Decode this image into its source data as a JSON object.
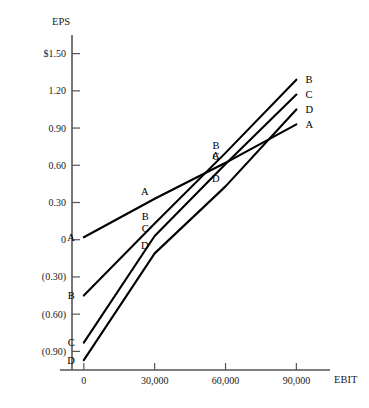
{
  "chart_data": {
    "type": "line",
    "title": "",
    "xlabel": "EBIT",
    "ylabel": "EPS",
    "xlim": [
      -5000,
      100000
    ],
    "ylim": [
      -1.05,
      1.65
    ],
    "grid": false,
    "legend": "none",
    "x_ticks": [
      {
        "value": 0,
        "label": "0"
      },
      {
        "value": 30000,
        "label": "30,000"
      },
      {
        "value": 60000,
        "label": "60,000"
      },
      {
        "value": 90000,
        "label": "90,000"
      }
    ],
    "y_ticks": [
      {
        "value": 1.5,
        "label": "$1.50"
      },
      {
        "value": 1.2,
        "label": "1.20"
      },
      {
        "value": 0.9,
        "label": "0.90"
      },
      {
        "value": 0.6,
        "label": "0.60"
      },
      {
        "value": 0.3,
        "label": "0.30"
      },
      {
        "value": 0.0,
        "label": "0"
      },
      {
        "value": -0.3,
        "label": "(0.30)"
      },
      {
        "value": -0.6,
        "label": "(0.60)"
      },
      {
        "value": -0.9,
        "label": "(0.90)"
      }
    ],
    "x": [
      0,
      30000,
      60000,
      90000
    ],
    "series": [
      {
        "name": "A",
        "label": "A",
        "values": [
          0.02,
          0.33,
          0.62,
          0.93
        ],
        "point_labels": [
          "A",
          "A",
          "A",
          "A"
        ]
      },
      {
        "name": "B",
        "label": "B",
        "values": [
          -0.45,
          0.13,
          0.7,
          1.29
        ],
        "point_labels": [
          "B",
          "B",
          "B",
          "B"
        ]
      },
      {
        "name": "C",
        "label": "C",
        "values": [
          -0.83,
          0.03,
          0.61,
          1.17
        ],
        "point_labels": [
          "C",
          "C",
          "C",
          "C"
        ]
      },
      {
        "name": "D",
        "label": "D",
        "values": [
          -0.97,
          -0.11,
          0.43,
          1.05
        ],
        "point_labels": [
          "D",
          "D",
          "D",
          "D"
        ]
      }
    ]
  }
}
